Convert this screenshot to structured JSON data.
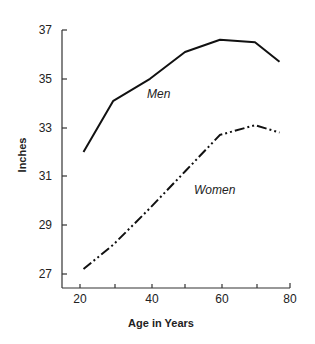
{
  "chart_data": {
    "type": "line",
    "title": "",
    "xlabel": "Age in Years",
    "ylabel": "Inches",
    "xlim": [
      20,
      80
    ],
    "ylim": [
      26.4,
      37
    ],
    "x_ticks": [
      20,
      30,
      40,
      50,
      60,
      70,
      80
    ],
    "x_tick_labels": [
      "20",
      "40",
      "60",
      "80"
    ],
    "y_ticks": [
      27,
      29,
      31,
      33,
      35,
      37
    ],
    "y_tick_labels": [
      "27",
      "29",
      "31",
      "33",
      "35",
      "37"
    ],
    "grid": false,
    "legend": "inline labels",
    "series": [
      {
        "name": "Men",
        "style": "solid",
        "x": [
          21,
          29.5,
          40,
          50,
          60,
          70,
          77
        ],
        "values": [
          32.0,
          34.1,
          35.0,
          36.1,
          36.6,
          36.5,
          35.7
        ]
      },
      {
        "name": "Women",
        "style": "dash-dot-dot",
        "x": [
          21,
          29.5,
          40,
          50,
          60,
          70,
          77
        ],
        "values": [
          27.2,
          28.2,
          29.7,
          31.2,
          32.7,
          33.1,
          32.8
        ]
      }
    ]
  },
  "labels": {
    "men": "Men",
    "women": "Women",
    "xlabel": "Age in Years",
    "ylabel": "Inches",
    "y": {
      "t27": "27",
      "t29": "29",
      "t31": "31",
      "t33": "33",
      "t35": "35",
      "t37": "37"
    },
    "x": {
      "t20": "20",
      "t40": "40",
      "t60": "60",
      "t80": "80"
    }
  }
}
